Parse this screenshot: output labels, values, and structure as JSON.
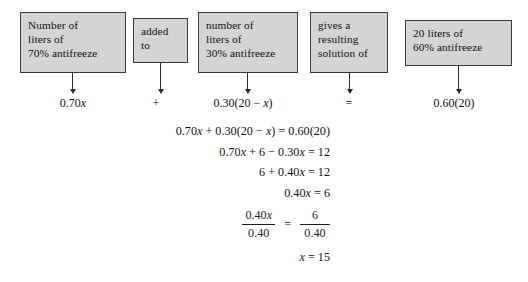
{
  "figure": {
    "type": "algebra-word-problem-diagram",
    "topic": "mixture problem: antifreeze solution"
  },
  "boxes": [
    {
      "id": "box-1",
      "name": "phrase-box-liters-70-percent",
      "lines": [
        "Number of",
        "liters of",
        "70% antifreeze"
      ]
    },
    {
      "id": "box-2",
      "name": "phrase-box-added-to",
      "lines": [
        "added",
        "to"
      ]
    },
    {
      "id": "box-3",
      "name": "phrase-box-liters-30-percent",
      "lines": [
        "number of",
        "liters of",
        "30% antifreeze"
      ]
    },
    {
      "id": "box-4",
      "name": "phrase-box-gives-resulting-solution",
      "lines": [
        "gives a",
        "resulting",
        "solution of"
      ]
    },
    {
      "id": "box-5",
      "name": "phrase-box-20-liters-60-percent",
      "lines": [
        "20 liters of",
        "60% antifreeze"
      ]
    }
  ],
  "expressions": [
    {
      "name": "expression-070x",
      "text": "0.70x"
    },
    {
      "name": "expression-plus",
      "text": "+"
    },
    {
      "name": "expression-030-20-minus-x",
      "text": "0.30(20 − x)"
    },
    {
      "name": "expression-equals",
      "text": "="
    },
    {
      "name": "expression-060-20",
      "text": "0.60(20)"
    }
  ],
  "solution_steps": [
    {
      "name": "equation-line-1",
      "text": "0.70x + 0.30(20 − x) = 0.60(20)"
    },
    {
      "name": "equation-line-2",
      "text": "0.70x + 6 − 0.30x = 12"
    },
    {
      "name": "equation-line-3",
      "text": "6 + 0.40x = 12"
    },
    {
      "name": "equation-line-4",
      "text": "0.40x = 6"
    }
  ],
  "fraction_step": {
    "name": "equation-line-fraction",
    "left_numerator": "0.40x",
    "left_denominator": "0.40",
    "equals": "=",
    "right_numerator": "6",
    "right_denominator": "0.40"
  },
  "final_answer": {
    "name": "equation-line-final",
    "text": "x = 15"
  },
  "colors": {
    "box_fill": "#d4d4d4",
    "box_border": "#3a3a3a",
    "text": "#111111",
    "arrow": "#2a2a2a",
    "background": "#ffffff"
  }
}
